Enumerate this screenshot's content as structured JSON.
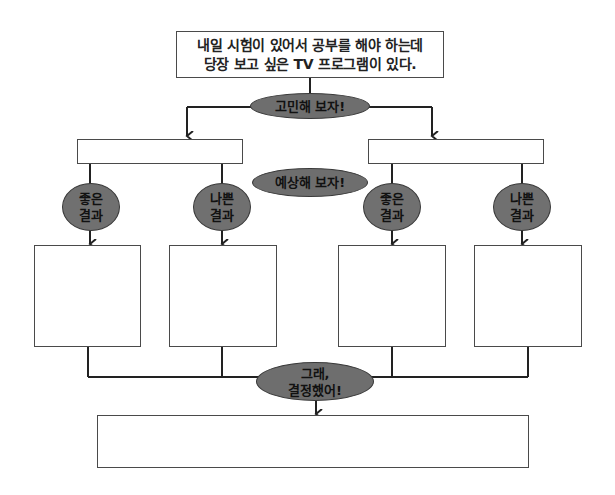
{
  "diagram": {
    "situation": {
      "line1": "내일 시험이 있어서 공부를 해야 하는데",
      "line2": "당장 보고 싶은 TV 프로그램이 있다."
    },
    "step1_label": "고민해 보자!",
    "step2_label": "예상해 보자!",
    "step3_label_line1": "그래,",
    "step3_label_line2": "결정했어!",
    "options": [
      {
        "choice_box_text": "",
        "outcomes": [
          {
            "label_line1": "좋은",
            "label_line2": "결과",
            "box_text": ""
          },
          {
            "label_line1": "나쁜",
            "label_line2": "결과",
            "box_text": ""
          }
        ]
      },
      {
        "choice_box_text": "",
        "outcomes": [
          {
            "label_line1": "좋은",
            "label_line2": "결과",
            "box_text": ""
          },
          {
            "label_line1": "나쁜",
            "label_line2": "결과",
            "box_text": ""
          }
        ]
      }
    ],
    "decision_box_text": ""
  },
  "colors": {
    "node_fill": "#6e6e6e",
    "line": "#222222",
    "box_border": "#4a4a4a"
  }
}
